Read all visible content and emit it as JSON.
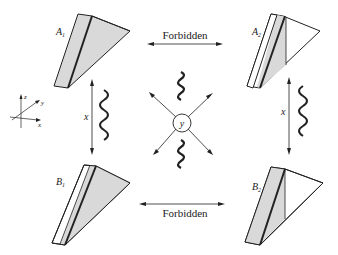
{
  "diagram": {
    "prisms": [
      {
        "id": "A1",
        "label": "A",
        "sub": "1"
      },
      {
        "id": "A2",
        "label": "A",
        "sub": "2"
      },
      {
        "id": "B1",
        "label": "B",
        "sub": "1"
      },
      {
        "id": "B2",
        "label": "B",
        "sub": "2"
      }
    ],
    "arrows": {
      "top_label": "Forbidden",
      "bottom_label": "Forbidden",
      "left_label": "x",
      "right_label": "x"
    },
    "center_label": "y",
    "axes": {
      "z": "z",
      "y": "y",
      "x": "x"
    },
    "colors": {
      "shade": "#d9d9d9",
      "ink": "#222222"
    }
  }
}
